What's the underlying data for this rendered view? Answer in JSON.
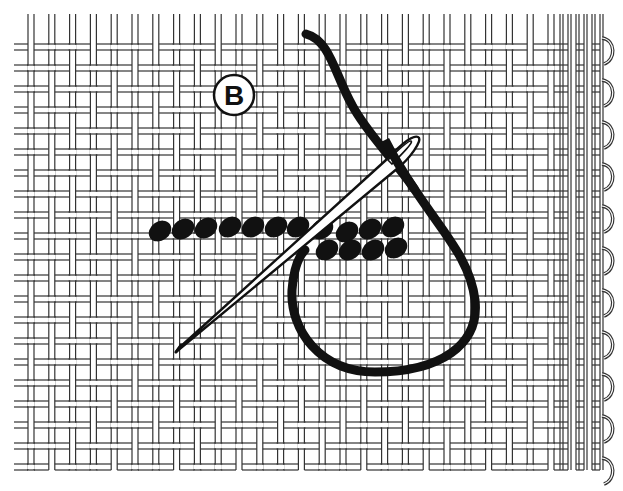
{
  "figure": {
    "type": "embroidery-stitch-illustration",
    "step_label": "B",
    "colors": {
      "background": "#ffffff",
      "ink": "#111111",
      "canvas_line": "#333333"
    },
    "canvas": {
      "weave": "basketweave-mesh",
      "left": 20,
      "top": 14,
      "right": 560,
      "bottom": 470,
      "pitch_x": 20.8,
      "pitch_y": 21,
      "selvage_x": 560,
      "selvage_right": 604
    },
    "stitches": {
      "top_row": [
        [
          160,
          231
        ],
        [
          183,
          229
        ],
        [
          206,
          228
        ],
        [
          230,
          227
        ],
        [
          253,
          227
        ],
        [
          276,
          227
        ],
        [
          298,
          227
        ],
        [
          322,
          229
        ],
        [
          347,
          232
        ],
        [
          370,
          229
        ],
        [
          393,
          227
        ]
      ],
      "bottom_row": [
        [
          327,
          250
        ],
        [
          350,
          250
        ],
        [
          373,
          250
        ],
        [
          396,
          248
        ]
      ]
    },
    "elements": [
      "needle",
      "thread-loop",
      "step-marker-B",
      "stitch-row",
      "canvas-mesh",
      "selvage-edge"
    ]
  }
}
